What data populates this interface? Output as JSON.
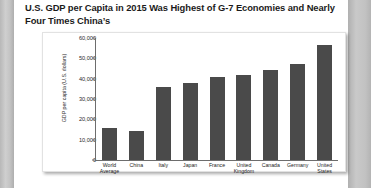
{
  "figure": {
    "title": "U.S. GDP per Capita in 2015 Was Highest of G-7 Economies and Nearly Four Times China’s"
  },
  "chart_data": {
    "type": "bar",
    "title": "U.S. GDP per Capita in 2015 Was Highest of G-7 Economies and Nearly Four Times China’s",
    "xlabel": "",
    "ylabel": "GDP per capita (U.S. dollars)",
    "categories": [
      "World Average",
      "China",
      "Italy",
      "Japan",
      "France",
      "United Kingdom",
      "Canada",
      "Germany",
      "United States"
    ],
    "values": [
      15500,
      14100,
      35800,
      38000,
      41000,
      41800,
      44500,
      47000,
      56500
    ],
    "ylim": [
      0,
      60000
    ],
    "yticks": [
      0,
      10000,
      20000,
      30000,
      40000,
      50000,
      60000
    ],
    "ytick_labels": [
      "0",
      "10,000",
      "20,000",
      "30,000",
      "40,000",
      "50,000",
      "60,000"
    ],
    "grid": false,
    "legend": null,
    "bar_color": "#4a4a4a"
  }
}
